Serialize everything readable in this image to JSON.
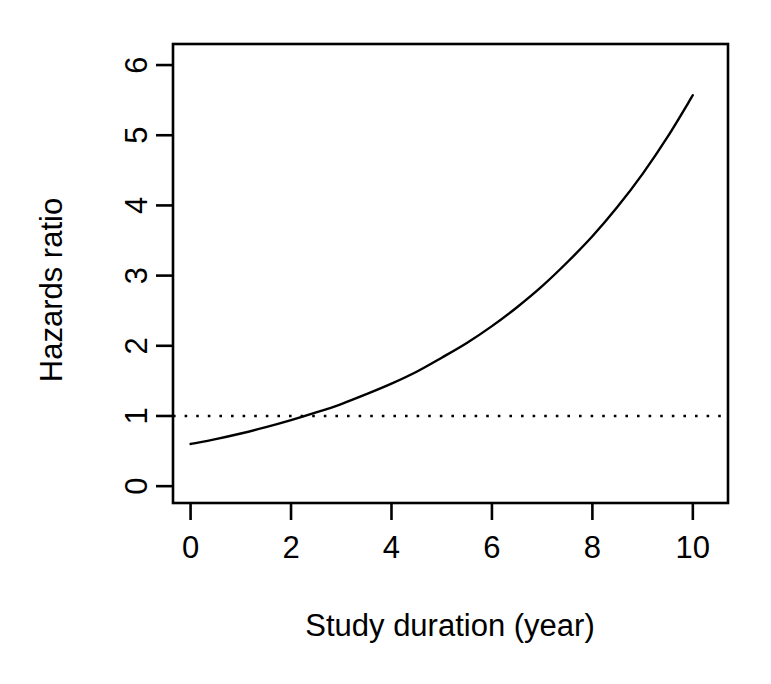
{
  "figure": {
    "background_color": "#ffffff",
    "foreground_color": "#000000",
    "width": 771,
    "height": 684
  },
  "chart_data": {
    "type": "line",
    "title": "",
    "xlabel": "Study duration (year)",
    "ylabel": "Hazards ratio",
    "xlim": [
      -0.35,
      10.7
    ],
    "ylim": [
      -0.24,
      6.3
    ],
    "xticks": [
      0,
      2,
      4,
      6,
      8,
      10
    ],
    "yticks": [
      0,
      1,
      2,
      3,
      4,
      5,
      6
    ],
    "xtick_labels": [
      "0",
      "2",
      "4",
      "6",
      "8",
      "10"
    ],
    "ytick_labels": [
      "0",
      "1",
      "2",
      "3",
      "4",
      "5",
      "6"
    ],
    "grid": false,
    "legend": null,
    "series": [
      {
        "name": "Hazards ratio",
        "style": "solid",
        "color": "#000000",
        "line_width": 2.4,
        "x": [
          0,
          0.5,
          1,
          1.5,
          2,
          2.5,
          3,
          3.5,
          4,
          4.5,
          5,
          5.5,
          6,
          6.5,
          7,
          7.5,
          8,
          8.5,
          9,
          9.5,
          10
        ],
        "values": [
          0.6,
          0.67,
          0.75,
          0.84,
          0.94,
          1.05,
          1.17,
          1.31,
          1.46,
          1.63,
          1.83,
          2.04,
          2.28,
          2.55,
          2.85,
          3.19,
          3.56,
          3.98,
          4.45,
          4.98,
          5.57
        ]
      },
      {
        "name": "Reference line (HR = 1)",
        "style": "dotted",
        "color": "#000000",
        "line_width": 2.4,
        "x": [
          -0.35,
          10.7
        ],
        "values": [
          1,
          1
        ]
      }
    ],
    "annotations": [
      {
        "text": "curve crosses HR = 1 at about year 3.4",
        "x": 3.4,
        "y": 1
      }
    ]
  },
  "axes": {
    "x_axis_name": "x-axis",
    "y_axis_name": "y-axis",
    "box_border": true
  }
}
